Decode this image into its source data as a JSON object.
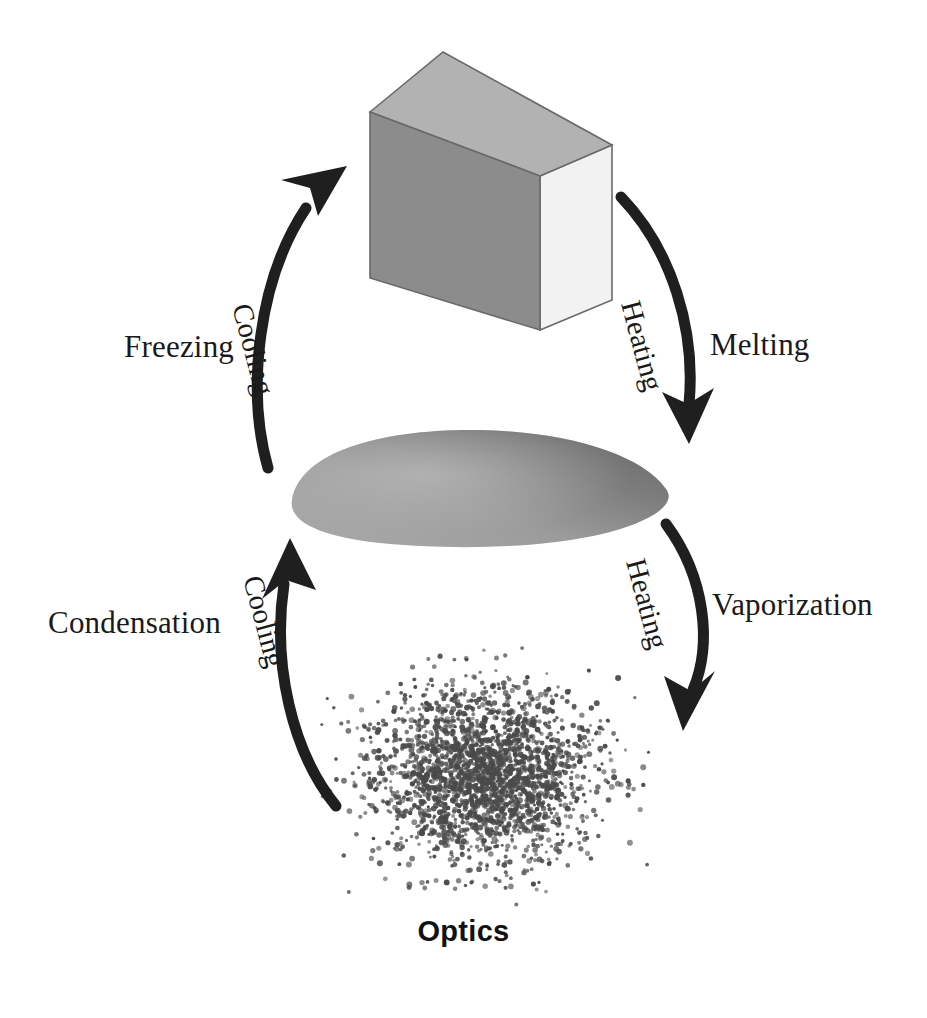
{
  "diagram": {
    "title": "Optics",
    "states": [
      {
        "name": "solid",
        "label": "solid-block"
      },
      {
        "name": "liquid",
        "label": "liquid-blob"
      },
      {
        "name": "gas",
        "label": "gas-particle-cloud"
      }
    ],
    "transitions": [
      {
        "id": "melting",
        "name_label": "Melting",
        "process_label": "Heating",
        "from": "solid",
        "to": "liquid",
        "direction": "down-right"
      },
      {
        "id": "vaporization",
        "name_label": "Vaporization",
        "process_label": "Heating",
        "from": "liquid",
        "to": "gas",
        "direction": "down-right"
      },
      {
        "id": "condensation",
        "name_label": "Condensation",
        "process_label": "Cooling",
        "from": "gas",
        "to": "liquid",
        "direction": "up-left"
      },
      {
        "id": "freezing",
        "name_label": "Freezing",
        "process_label": "Cooling",
        "from": "liquid",
        "to": "solid",
        "direction": "up-right"
      }
    ],
    "colors": {
      "arrow": "#1f1f1f",
      "text": "#1a1a1a",
      "block_top": "#b2b2b2",
      "block_front": "#8c8c8c",
      "block_side": "#f2f2f2",
      "block_edge": "#5a5a5a",
      "liquid_dark": "#6f6f6f",
      "liquid_light": "#a6a6a6",
      "gas_dot": "#4a4a4a",
      "background": "#ffffff"
    }
  }
}
